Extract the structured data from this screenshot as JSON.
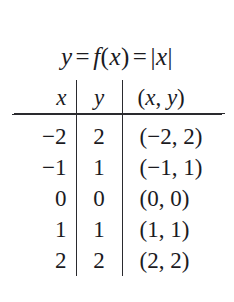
{
  "figure": {
    "formula": {
      "lhs": "y",
      "eq1": "=",
      "fn": "f",
      "fn_open": "(",
      "fn_arg": "x",
      "fn_close": ")",
      "eq2": "=",
      "abs_open": "|",
      "abs_arg": "x",
      "abs_close": "|",
      "plain": "y = f(x) = |x|"
    },
    "table": {
      "headers": {
        "x": "x",
        "y": "y",
        "pair_open": "(",
        "pair_x": "x",
        "pair_comma": ",",
        "pair_y": "y",
        "pair_close": ")",
        "pair_plain": "(x, y)"
      },
      "rows": [
        {
          "x": "−2",
          "y": "2",
          "pair": "(−2, 2)"
        },
        {
          "x": "−1",
          "y": "1",
          "pair": "(−1, 1)"
        },
        {
          "x": "0",
          "y": "0",
          "pair": "(0, 0)"
        },
        {
          "x": "1",
          "y": "1",
          "pair": "(1, 1)"
        },
        {
          "x": "2",
          "y": "2",
          "pair": "(2, 2)"
        }
      ]
    },
    "colors": {
      "background": "#ffffff",
      "text": "#1b1b1f",
      "rule": "#2a2a2e"
    }
  }
}
